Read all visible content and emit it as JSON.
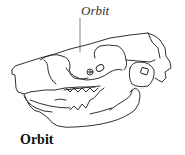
{
  "figure": {
    "callout": {
      "label": "Orbit"
    },
    "caption": "Orbit",
    "colors": {
      "line": "#1a1a1a",
      "background": "#ffffff",
      "leader": "#555555"
    }
  }
}
